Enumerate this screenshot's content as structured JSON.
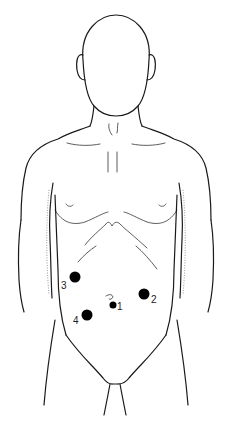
{
  "figure": {
    "markers": [
      {
        "label": "1",
        "cx": 113,
        "cy": 305,
        "r": 3.5,
        "label_x": 117,
        "label_y": 310
      },
      {
        "label": "2",
        "cx": 144,
        "cy": 294,
        "r": 5.5,
        "label_x": 151,
        "label_y": 303
      },
      {
        "label": "3",
        "cx": 75,
        "cy": 277,
        "r": 5.5,
        "label_x": 61,
        "label_y": 289
      },
      {
        "label": "4",
        "cx": 87,
        "cy": 315,
        "r": 5.5,
        "label_x": 73,
        "label_y": 324
      }
    ],
    "colors": {
      "ink": "#1a1a1a",
      "marker": "#000000",
      "background": "#ffffff"
    }
  }
}
